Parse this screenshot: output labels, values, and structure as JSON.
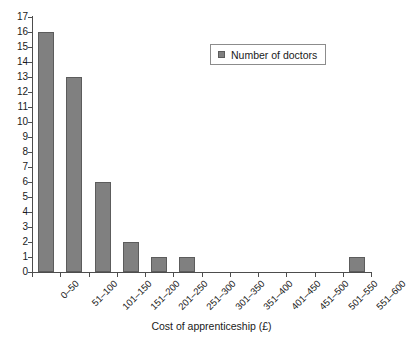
{
  "chart_data": {
    "type": "bar",
    "title": "",
    "subtitle": "",
    "xlabel": "Cost of apprenticeship (£)",
    "ylabel": "",
    "categories": [
      "0–50",
      "51–100",
      "101–150",
      "151–200",
      "201–250",
      "251–300",
      "301–350",
      "351–400",
      "401–450",
      "451–500",
      "501–550",
      "551–600"
    ],
    "values": [
      16,
      13,
      6,
      2,
      1,
      1,
      0,
      0,
      0,
      0,
      0,
      1
    ],
    "series": [
      {
        "name": "Number of doctors",
        "values": [
          16,
          13,
          6,
          2,
          1,
          1,
          0,
          0,
          0,
          0,
          0,
          1
        ]
      }
    ],
    "ylim": [
      0,
      17
    ],
    "ytick_step": 1,
    "yticks": [
      "0",
      "1",
      "2",
      "3",
      "4",
      "5",
      "6",
      "7",
      "8",
      "9",
      "10",
      "11",
      "12",
      "13",
      "14",
      "15",
      "16",
      "17"
    ],
    "grid": false,
    "legend": {
      "position": "top-right",
      "entries": [
        {
          "label": "Number of doctors",
          "color": "#808080"
        }
      ]
    },
    "bar_color": "#808080",
    "bar_border_color": "#5c5c5c",
    "axis_color": "#4d4d4d",
    "text_color": "#1a1a1a",
    "background": "#ffffff"
  }
}
